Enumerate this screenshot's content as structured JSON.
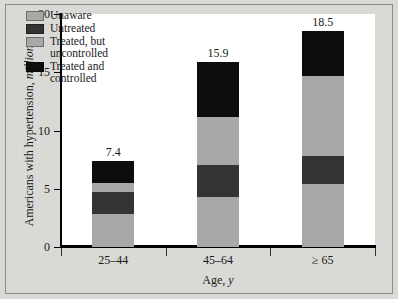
{
  "chart_data": {
    "type": "bar",
    "subtype": "stacked-bar",
    "title": "",
    "xlabel": "Age, y",
    "xlabel_italic_part": "y",
    "ylabel": "Americans with hypertension, millions",
    "ylabel_italic_part": "millions",
    "categories": [
      "25–44",
      "45–64",
      "≥ 65"
    ],
    "ylim": [
      0,
      20
    ],
    "yticks": [
      0,
      5,
      10,
      15,
      20
    ],
    "ytick_labels": [
      "0",
      "5",
      "10",
      "15",
      "20"
    ],
    "grid": false,
    "legend_position": "upper-left-inside",
    "series": [
      {
        "name": "Unaware",
        "color": "#a8a8a8",
        "values": [
          2.8,
          4.3,
          5.4
        ]
      },
      {
        "name": "Untreated",
        "color": "#333333",
        "values": [
          1.9,
          2.7,
          2.4
        ]
      },
      {
        "name": "Treated, but uncontrolled",
        "color": "#a8a8a8",
        "values": [
          0.8,
          4.2,
          6.9
        ]
      },
      {
        "name": "Treated and controlled",
        "color": "#0d0d0d",
        "values": [
          1.9,
          4.7,
          3.8
        ]
      }
    ],
    "totals": [
      7.4,
      15.9,
      18.5
    ],
    "total_labels": [
      "7.4",
      "15.9",
      "18.5"
    ]
  },
  "legend": {
    "items": [
      {
        "label": "Unaware",
        "color": "#a8a8a8"
      },
      {
        "label": "Untreated",
        "color": "#333333"
      },
      {
        "label": "Treated, but\nuncontrolled",
        "color": "#a8a8a8"
      },
      {
        "label": "Treated and\ncontrolled",
        "color": "#0d0d0d"
      }
    ]
  },
  "axes": {
    "y_title_prefix": "Americans with hypertension, ",
    "y_title_italic": "millions",
    "x_title_prefix": "Age, ",
    "x_title_italic": "y"
  },
  "colors": {
    "page_background": "#d9d9d6",
    "plot_background": "#ffffff",
    "axis": "#000000",
    "text": "#1a1a1a",
    "light_gray": "#a8a8a8",
    "dark_gray": "#333333",
    "black": "#0d0d0d"
  }
}
